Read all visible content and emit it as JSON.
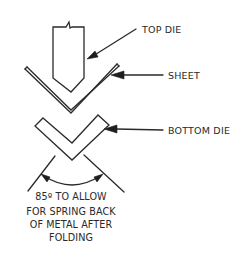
{
  "diagram": {
    "labels": {
      "top_die": "TOP DIE",
      "sheet": "SHEET",
      "bottom_die": "BOTTOM DIE"
    },
    "note": {
      "lines": [
        "85º TO ALLOW",
        "FOR SPRING BACK",
        "OF METAL AFTER",
        "FOLDING"
      ]
    },
    "angle_degrees": 85,
    "colors": {
      "line": "#2a2a2a",
      "background": "#ffffff"
    }
  }
}
